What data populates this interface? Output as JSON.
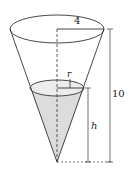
{
  "diagram": {
    "type": "conical tank partially filled with water",
    "labels": {
      "top_radius": "4",
      "water_radius": "r",
      "water_height": "h",
      "total_height": "10"
    },
    "colors": {
      "stroke": "#333333",
      "water_fill": "#d9d9d9",
      "background": "#ffffff"
    }
  }
}
